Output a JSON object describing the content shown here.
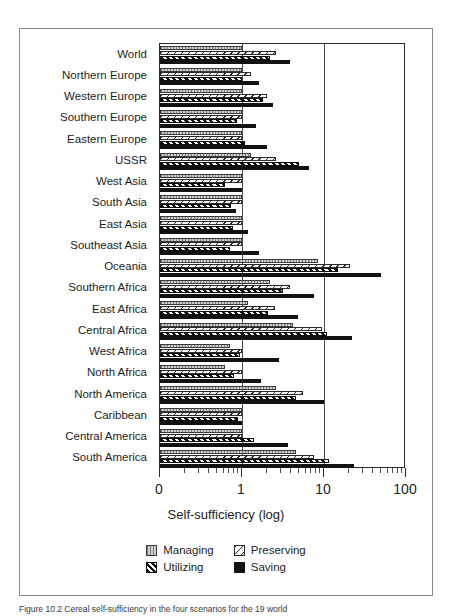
{
  "chart_data": {
    "type": "bar",
    "orientation": "horizontal",
    "title": "",
    "xlabel": "Self-sufficiency (log)",
    "ylabel": "",
    "xscale": "log",
    "xtick_labels": [
      "0",
      "1",
      "10",
      "100"
    ],
    "xtick_values": [
      0.1,
      1,
      10,
      100
    ],
    "xlim": [
      0.1,
      100
    ],
    "grid": true,
    "gridlines_at": [
      1,
      10
    ],
    "legend_position": "bottom-center",
    "series_order": [
      "Managing",
      "Preserving",
      "Utilizing",
      "Saving"
    ],
    "categories": [
      "World",
      "Northern Europe",
      "Western Europe",
      "Southern Europe",
      "Eastern Europe",
      "USSR",
      "West Asia",
      "South Asia",
      "East Asia",
      "Southeast Asia",
      "Oceania",
      "Southern Africa",
      "East Africa",
      "Central Africa",
      "West Africa",
      "North Africa",
      "North America",
      "Caribbean",
      "Central America",
      "South America"
    ],
    "series": [
      {
        "name": "Managing",
        "color": "#cfcfcf",
        "values": [
          1.0,
          1.0,
          1.0,
          1.0,
          1.0,
          1.3,
          1.0,
          1.0,
          1.0,
          1.0,
          8.5,
          2.2,
          1.2,
          4.2,
          0.72,
          0.62,
          2.6,
          1.0,
          1.0,
          4.6
        ]
      },
      {
        "name": "Preserving",
        "color": "#ffffff",
        "values": [
          2.6,
          1.3,
          2.0,
          1.0,
          1.0,
          2.6,
          1.0,
          1.0,
          1.0,
          1.0,
          21.0,
          3.8,
          2.5,
          9.5,
          1.0,
          1.0,
          5.5,
          1.0,
          1.0,
          7.5
        ]
      },
      {
        "name": "Utilizing",
        "color": "#0d0d0d",
        "values": [
          2.2,
          1.0,
          1.8,
          0.88,
          1.1,
          5.0,
          0.62,
          0.74,
          0.78,
          0.72,
          15.0,
          3.2,
          2.1,
          11.0,
          0.95,
          0.8,
          4.6,
          0.9,
          1.4,
          11.5
        ]
      },
      {
        "name": "Saving",
        "color": "#111111",
        "values": [
          3.8,
          1.6,
          2.4,
          1.5,
          2.0,
          6.5,
          1.0,
          0.85,
          1.2,
          1.6,
          50.0,
          7.5,
          4.8,
          22.0,
          2.8,
          1.7,
          10.0,
          1.0,
          3.6,
          23.0
        ]
      }
    ]
  },
  "axis": {
    "xtitle": "Self-sufficiency (log)"
  },
  "legend": {
    "items": [
      {
        "label": "Managing",
        "key": "managing",
        "swatch": "managing-swatch"
      },
      {
        "label": "Preserving",
        "key": "preserving",
        "swatch": "preserving-swatch"
      },
      {
        "label": "Utilizing",
        "key": "utilizing",
        "swatch": "utilizing-swatch"
      },
      {
        "label": "Saving",
        "key": "saving",
        "swatch": "saving-swatch"
      }
    ]
  },
  "caption": {
    "text": "Figure 10.2 Cereal self-sufficiency in the four scenarios for the 19 world"
  }
}
